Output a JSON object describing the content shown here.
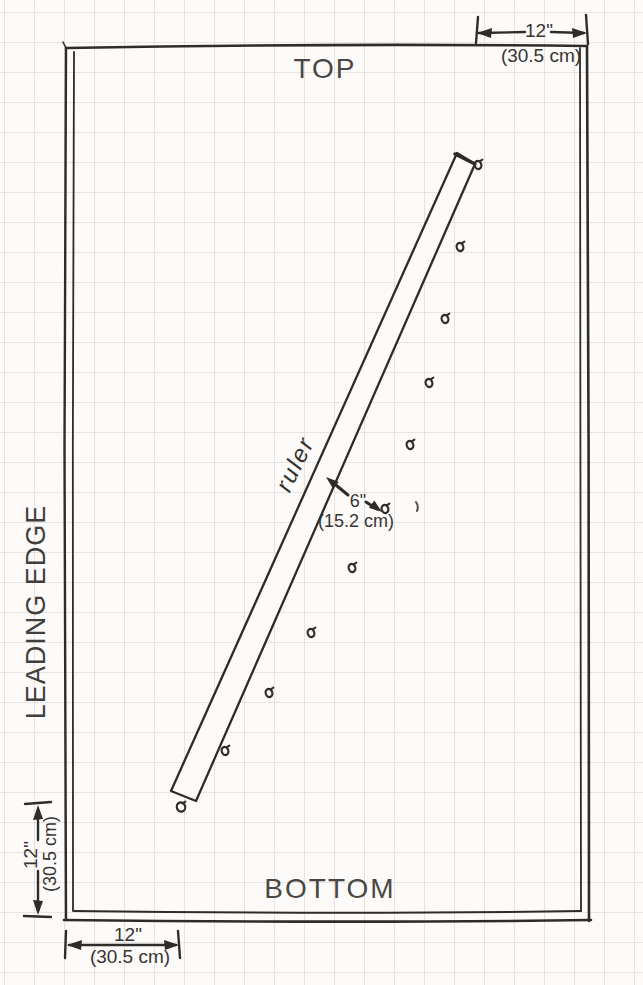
{
  "labels": {
    "top": "TOP",
    "bottom": "BOTTOM",
    "leading_edge": "LEADING EDGE",
    "ruler": "ruler"
  },
  "dimensions": {
    "top_right": {
      "inches": "12\"",
      "cm": "(30.5 cm)"
    },
    "ruler_to_pins": {
      "inches": "6\"",
      "cm": "(15.2 cm)"
    },
    "bottom_horizontal": {
      "inches": "12\"",
      "cm": "(30.5 cm)"
    },
    "left_vertical": {
      "inches": "12\"",
      "cm": "(30.5 cm)"
    }
  },
  "colors": {
    "ink": "#2e2c29",
    "paper": "#fcfbfa",
    "grid": "#d9d0ce",
    "text": "#45423f"
  },
  "geometry": {
    "grid_size": 30,
    "frame": {
      "left": 66,
      "top": 46,
      "right": 588,
      "bottom": 920
    },
    "ruler_polygon": [
      [
        457,
        153
      ],
      [
        475,
        164
      ],
      [
        196,
        801
      ],
      [
        171,
        791
      ]
    ],
    "pins": [
      [
        478,
        165
      ],
      [
        460,
        247
      ],
      [
        445,
        319
      ],
      [
        429,
        383
      ],
      [
        410,
        445
      ],
      [
        385,
        509
      ],
      [
        352,
        568
      ],
      [
        311,
        633
      ],
      [
        269,
        693
      ],
      [
        225,
        751
      ],
      [
        181,
        807
      ]
    ]
  }
}
